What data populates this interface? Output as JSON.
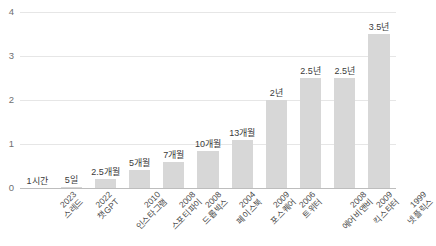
{
  "chart_data": {
    "type": "bar",
    "title": "",
    "subtitle": "",
    "xlabel": "",
    "ylabel": "",
    "ylim": [
      0,
      4
    ],
    "yticks": [
      "0",
      "1",
      "2",
      "3",
      "4"
    ],
    "grid": true,
    "legend": null,
    "unit_note": "년 (years to reach 1 million users)",
    "categories": [
      "2023 스레드",
      "2022 챗GPT",
      "2010 인스타그램",
      "2008 스포티파이",
      "2008 드롭박스",
      "2004 페이스북",
      "2009 포스퀘어",
      "2006 트위터",
      "2008 에어비앤비",
      "2009 킥스타터",
      "1999 넷플릭스"
    ],
    "values": [
      0.0001,
      0.0137,
      0.2083,
      0.4167,
      0.5833,
      0.8333,
      1.0833,
      2.0,
      2.5,
      2.5,
      3.5
    ],
    "data_labels": [
      "1시간",
      "5일",
      "2.5개월",
      "5개월",
      "7개월",
      "10개월",
      "13개월",
      "2년",
      "2.5년",
      "2.5년",
      "3.5년"
    ],
    "bars": [
      {
        "year": "2023",
        "name": "스레드",
        "label": "1시간",
        "value": 0.0001
      },
      {
        "year": "2022",
        "name": "챗GPT",
        "label": "5일",
        "value": 0.0137
      },
      {
        "year": "2010",
        "name": "인스타그램",
        "label": "2.5개월",
        "value": 0.2083
      },
      {
        "year": "2008",
        "name": "스포티파이",
        "label": "5개월",
        "value": 0.4167
      },
      {
        "year": "2008",
        "name": "드롭박스",
        "label": "7개월",
        "value": 0.5833
      },
      {
        "year": "2004",
        "name": "페이스북",
        "label": "10개월",
        "value": 0.8333
      },
      {
        "year": "2009",
        "name": "포스퀘어",
        "label": "13개월",
        "value": 1.0833
      },
      {
        "year": "2006",
        "name": "트위터",
        "label": "2년",
        "value": 2.0
      },
      {
        "year": "2008",
        "name": "에어비앤비",
        "label": "2.5년",
        "value": 2.5
      },
      {
        "year": "2009",
        "name": "킥스타터",
        "label": "2.5년",
        "value": 2.5
      },
      {
        "year": "1999",
        "name": "넷플릭스",
        "label": "3.5년",
        "value": 3.5
      }
    ],
    "colors": {
      "bar_fill": "#d7d7d7",
      "gridline": "#e6e6e6",
      "axis_line": "#bdbdbd",
      "tick_text": "#707070",
      "value_text": "#3a3a3a",
      "category_text": "#4a4a4a",
      "background": "#ffffff"
    }
  }
}
